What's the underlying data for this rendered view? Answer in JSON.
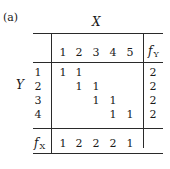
{
  "figure": {
    "label": "(a)",
    "column_variable": "X",
    "row_variable": "Y"
  },
  "table": {
    "column_headers": [
      "1",
      "2",
      "3",
      "4",
      "5"
    ],
    "marginal_column_header": {
      "symbol": "f",
      "subscript": "Y"
    },
    "row_headers": [
      "1",
      "2",
      "3",
      "4"
    ],
    "cells": [
      [
        "1",
        "1",
        "",
        "",
        ""
      ],
      [
        "",
        "1",
        "1",
        "",
        ""
      ],
      [
        "",
        "",
        "1",
        "1",
        ""
      ],
      [
        "",
        "",
        "",
        "1",
        "1"
      ]
    ],
    "row_marginals": [
      "2",
      "2",
      "2",
      "2"
    ],
    "marginal_row_header": {
      "symbol": "f",
      "subscript": "X"
    },
    "column_marginals": [
      "1",
      "2",
      "2",
      "2",
      "1"
    ]
  }
}
